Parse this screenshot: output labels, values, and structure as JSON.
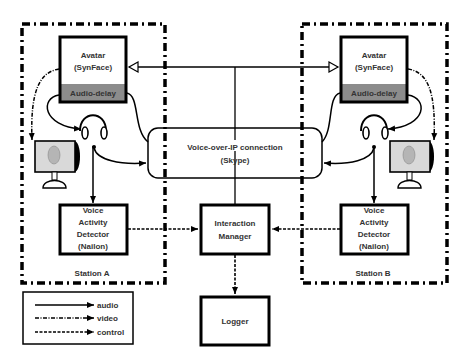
{
  "diagram": {
    "stations": [
      {
        "id": "A",
        "label": "Station A",
        "avatar": {
          "title": "Avatar",
          "subtitle": "(SynFace)",
          "delay_label": "Audio-delay"
        },
        "vad": {
          "line1": "Voice",
          "line2": "Activity",
          "line3": "Detector",
          "line4": "(Nailon)"
        }
      },
      {
        "id": "B",
        "label": "Station B",
        "avatar": {
          "title": "Avatar",
          "subtitle": "(SynFace)",
          "delay_label": "Audio-delay"
        },
        "vad": {
          "line1": "Voice",
          "line2": "Activity",
          "line3": "Detector",
          "line4": "(Nailon)"
        }
      }
    ],
    "voip": {
      "line1": "Voice-over-IP connection",
      "line2": "(Skype)"
    },
    "interaction_manager": {
      "line1": "Interaction",
      "line2": "Manager"
    },
    "logger": {
      "label": "Logger"
    },
    "legend": {
      "items": [
        {
          "label": "audio",
          "style": "solid"
        },
        {
          "label": "video",
          "style": "dash-dot"
        },
        {
          "label": "control",
          "style": "dashed"
        }
      ]
    },
    "colors": {
      "stroke": "#000000",
      "audio_delay_fill": "#8c8c8c",
      "monitor_fill": "#d9d9d9",
      "text": "#333333"
    }
  }
}
